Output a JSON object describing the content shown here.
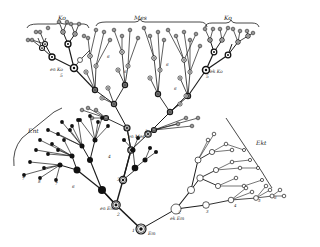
{
  "diagram": {
    "type": "branching-tree",
    "colors": {
      "ink": "#1a1a1a",
      "paper": "#ffffff"
    },
    "group_labels": {
      "top_left": "Ko",
      "top_center": "Mes",
      "top_right": "Ko",
      "left": "Ent",
      "right": "Ekt"
    },
    "node_labels": {
      "root": "Em",
      "root_num": "1",
      "left_base": "en Em",
      "left_base_num": "2",
      "right_base": "ek Em",
      "right_base_num": "2",
      "mid_left": "3",
      "mid_center": "en Mes",
      "mid_center_num": "3",
      "mid_right": "4",
      "ko_left": "en Ko",
      "ko_left_num": "5",
      "ko_right": "ek Ko",
      "ko_right_num": "5",
      "ent_tips": [
        "7",
        "8",
        "7",
        "6"
      ],
      "ekt_tips": [
        "3",
        "4",
        "5",
        "6"
      ],
      "mes_small": [
        "6",
        "6",
        "6",
        "6"
      ]
    }
  }
}
